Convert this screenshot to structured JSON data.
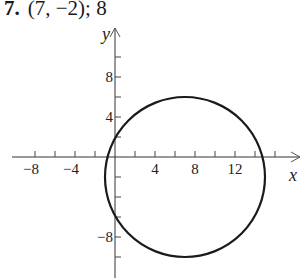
{
  "problem": {
    "number": "7.",
    "answer": "(7, −2); 8"
  },
  "chart_data": {
    "type": "scatter",
    "title": "(7, −2); 8",
    "circle": {
      "center": [
        7,
        -2
      ],
      "radius": 8
    },
    "xlabel": "x",
    "ylabel": "y",
    "x_ticks": [
      -8,
      -6,
      -4,
      -2,
      2,
      4,
      6,
      8,
      10,
      12,
      14,
      16
    ],
    "x_tick_labels": [
      "−8",
      "−4",
      "4",
      "8",
      "12"
    ],
    "x_tick_label_values": [
      -8,
      -4,
      4,
      8,
      12
    ],
    "y_ticks": [
      -10,
      -8,
      -6,
      -4,
      -2,
      2,
      4,
      6,
      8,
      10
    ],
    "y_tick_labels": [
      "8",
      "4",
      "−8"
    ],
    "y_tick_label_values": [
      8,
      4,
      -8
    ],
    "xlim": [
      -10,
      18
    ],
    "ylim": [
      -12,
      13
    ],
    "grid": false,
    "stroke_color": "#1a1a1a"
  },
  "layout": {
    "origin_px": [
      115,
      157
    ],
    "px_per_unit": 10
  }
}
